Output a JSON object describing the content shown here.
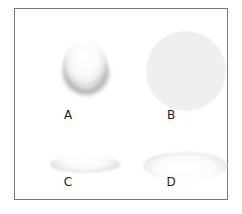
{
  "figure": {
    "panels": [
      {
        "label": "A",
        "shape": "shaded-sphere-bottom-shadow"
      },
      {
        "label": "B",
        "shape": "flat-gray-circle"
      },
      {
        "label": "C",
        "shape": "flat-ellipse-raised"
      },
      {
        "label": "D",
        "shape": "flat-ellipse-recessed"
      }
    ],
    "colors": {
      "frame": "#7a7a7a",
      "circle_fill": "#efefef",
      "background": "#ffffff"
    }
  }
}
